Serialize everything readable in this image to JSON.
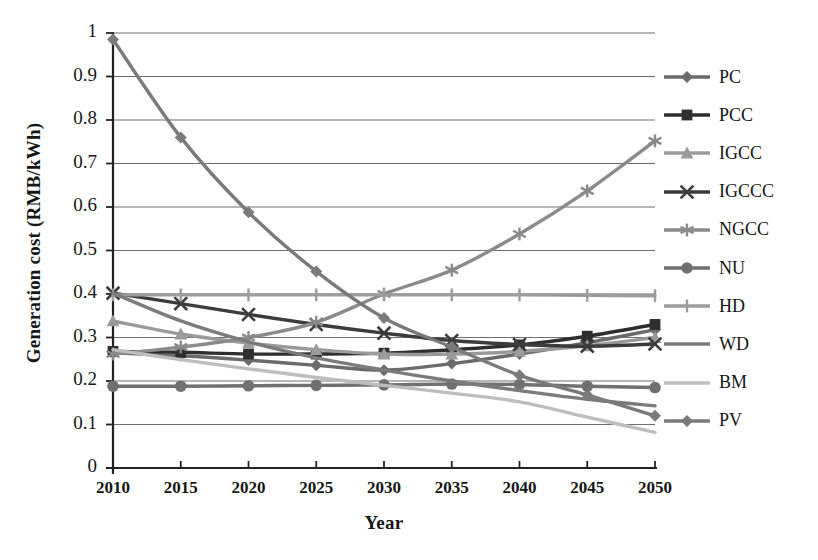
{
  "chart_data": {
    "type": "line",
    "title": "",
    "xlabel": "Year",
    "ylabel": "Generation cost (RMB/kWh)",
    "x": [
      2010,
      2015,
      2020,
      2025,
      2030,
      2035,
      2040,
      2045,
      2050
    ],
    "xtick_labels": [
      "2010",
      "2015",
      "2020",
      "2025",
      "2030",
      "2035",
      "2040",
      "2045",
      "2050"
    ],
    "ytick_labels": [
      "0",
      "0.1",
      "0.2",
      "0.3",
      "0.4",
      "0.5",
      "0.6",
      "0.7",
      "0.8",
      "0.9",
      "1"
    ],
    "ylim": [
      0,
      1
    ],
    "xlim": [
      2010,
      2050
    ],
    "grid": "horizontal",
    "legend_position": "right",
    "series": [
      {
        "name": "PC",
        "marker": "diamond",
        "color": "#6b6b6b",
        "values": [
          0.265,
          0.258,
          0.248,
          0.236,
          0.225,
          0.24,
          0.262,
          0.288,
          0.318
        ]
      },
      {
        "name": "PCC",
        "marker": "square",
        "color": "#2e2e2e",
        "values": [
          0.268,
          0.266,
          0.262,
          0.262,
          0.264,
          0.272,
          0.283,
          0.303,
          0.33
        ]
      },
      {
        "name": "IGCC",
        "marker": "triangle",
        "color": "#9a9a9a",
        "values": [
          0.338,
          0.308,
          0.287,
          0.272,
          0.262,
          0.262,
          0.268,
          0.281,
          0.3
        ]
      },
      {
        "name": "IGCCC",
        "marker": "x",
        "color": "#3c3c3c",
        "values": [
          0.402,
          0.378,
          0.353,
          0.33,
          0.31,
          0.293,
          0.284,
          0.28,
          0.285
        ]
      },
      {
        "name": "NGCC",
        "marker": "asterisk",
        "color": "#8a8a8a",
        "values": [
          0.262,
          0.278,
          0.3,
          0.335,
          0.4,
          0.455,
          0.538,
          0.637,
          0.752
        ]
      },
      {
        "name": "NU",
        "marker": "circle",
        "color": "#707070",
        "values": [
          0.188,
          0.188,
          0.189,
          0.19,
          0.191,
          0.193,
          0.192,
          0.188,
          0.185
        ]
      },
      {
        "name": "HD",
        "marker": "plus",
        "color": "#9c9c9c",
        "values": [
          0.398,
          0.398,
          0.398,
          0.398,
          0.398,
          0.398,
          0.398,
          0.397,
          0.396
        ]
      },
      {
        "name": "WD",
        "marker": "none",
        "color": "#7b7b7b",
        "values": [
          0.402,
          0.338,
          0.29,
          0.253,
          0.225,
          0.2,
          0.178,
          0.158,
          0.143
        ]
      },
      {
        "name": "BM",
        "marker": "none",
        "color": "#bdbdbd",
        "values": [
          0.272,
          0.249,
          0.228,
          0.208,
          0.19,
          0.172,
          0.152,
          0.117,
          0.082
        ]
      },
      {
        "name": "PV",
        "marker": "diamond",
        "color": "#7a7a7a",
        "values": [
          0.985,
          0.76,
          0.588,
          0.452,
          0.345,
          0.278,
          0.213,
          0.168,
          0.12
        ]
      }
    ]
  },
  "legend": {
    "items": [
      {
        "label": "PC"
      },
      {
        "label": "PCC"
      },
      {
        "label": "IGCC"
      },
      {
        "label": "IGCCC"
      },
      {
        "label": "NGCC"
      },
      {
        "label": "NU"
      },
      {
        "label": "HD"
      },
      {
        "label": "WD"
      },
      {
        "label": "BM"
      },
      {
        "label": "PV"
      }
    ]
  }
}
